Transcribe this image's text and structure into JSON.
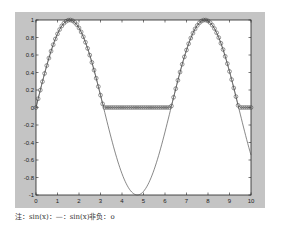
{
  "chart_data": {
    "type": "line",
    "title": "",
    "xlabel": "",
    "ylabel": "",
    "xlim": [
      0,
      10
    ],
    "ylim": [
      -1,
      1
    ],
    "x_ticks": [
      "0",
      "1",
      "2",
      "3",
      "4",
      "5",
      "6",
      "7",
      "8",
      "9",
      "10"
    ],
    "y_ticks": [
      "1",
      "0.8",
      "0.6",
      "0.4",
      "0.2",
      "0",
      "-0.2",
      "-0.4",
      "-0.6",
      "-0.8",
      "-1"
    ],
    "grid": false,
    "series": [
      {
        "name": "sin(x)",
        "style": "solid line",
        "function": "sin(x)",
        "x_range": [
          0,
          10
        ]
      },
      {
        "name": "sin(x) non-negative",
        "style": "circle markers with line",
        "function": "max(sin(x),0)",
        "x_range": [
          0,
          10
        ],
        "step": 0.1
      }
    ]
  },
  "caption": "注：sin(x)：—：sin(x)非负：o",
  "colors": {
    "frame": "#c4c4c4",
    "plot_bg": "#ffffff",
    "line": "#555555",
    "marker": "#444444"
  }
}
